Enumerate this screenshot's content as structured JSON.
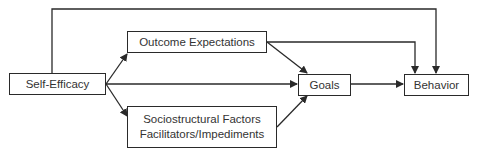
{
  "diagram": {
    "nodes": {
      "self_efficacy": {
        "label": "Self-Efficacy"
      },
      "outcome_expectations": {
        "label": "Outcome Expectations"
      },
      "sociostructural": {
        "line1": "Sociostructural Factors",
        "line2": "Facilitators/Impediments"
      },
      "goals": {
        "label": "Goals"
      },
      "behavior": {
        "label": "Behavior"
      }
    },
    "edges": [
      {
        "from": "Self-Efficacy",
        "to": "Outcome Expectations"
      },
      {
        "from": "Self-Efficacy",
        "to": "Goals"
      },
      {
        "from": "Self-Efficacy",
        "to": "Sociostructural Factors Facilitators/Impediments"
      },
      {
        "from": "Self-Efficacy",
        "to": "Behavior"
      },
      {
        "from": "Outcome Expectations",
        "to": "Goals"
      },
      {
        "from": "Outcome Expectations",
        "to": "Behavior"
      },
      {
        "from": "Sociostructural Factors Facilitators/Impediments",
        "to": "Goals"
      },
      {
        "from": "Goals",
        "to": "Behavior"
      }
    ],
    "colors": {
      "line": "#2a2a2a",
      "text": "#333333",
      "background": "#ffffff"
    }
  }
}
